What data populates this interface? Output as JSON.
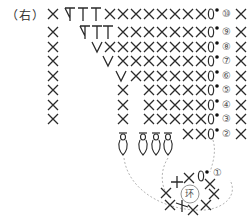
{
  "diagram": {
    "title_label": "（右）",
    "side": "右",
    "ring_label": "环",
    "rows": [
      {
        "number": 10,
        "circle": "⑩",
        "y": 14,
        "stitches": "××××××××0•"
      },
      {
        "number": 9,
        "circle": "⑨",
        "y": 32,
        "stitches": "×××××××0•"
      },
      {
        "number": 8,
        "circle": "⑧",
        "y": 47,
        "stitches": "×××××××0•"
      },
      {
        "number": 7,
        "circle": "⑦",
        "y": 61,
        "stitches": "××××××0•"
      },
      {
        "number": 6,
        "circle": "⑥",
        "y": 76,
        "stitches": "×××××0•"
      },
      {
        "number": 5,
        "circle": "⑤",
        "y": 90,
        "stitches": "×××××0•"
      },
      {
        "number": 4,
        "circle": "④",
        "y": 105,
        "stitches": "×××××0•"
      },
      {
        "number": 3,
        "circle": "③",
        "y": 119,
        "stitches": "×××××0•"
      },
      {
        "number": 2,
        "circle": "②",
        "y": 134,
        "stitches": "××0•"
      },
      {
        "number": 1,
        "circle": "①",
        "y": 178,
        "stitches": "×0•"
      }
    ],
    "left_column_stitch": "×",
    "right_column_stitch": "×",
    "legend_symbols": {
      "sc": "×",
      "ch": "0",
      "slst": "•",
      "inc": "V",
      "dc": "T"
    }
  }
}
